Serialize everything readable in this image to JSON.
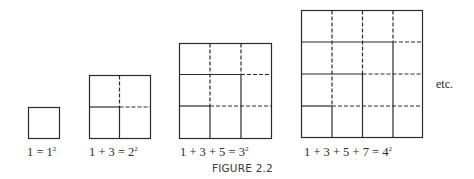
{
  "figure": {
    "caption": "FIGURE 2.2",
    "continuation_label": "etc.",
    "line_color": "#2a2a2a",
    "panels": [
      {
        "n": 1,
        "lhs": "1 = 1",
        "exponent": "2",
        "box": {
          "x": 28,
          "y": 107,
          "size": 31
        }
      },
      {
        "n": 2,
        "lhs": "1 + 3 = 2",
        "exponent": "2",
        "box": {
          "x": 89,
          "y": 75,
          "size": 62
        }
      },
      {
        "n": 3,
        "lhs": "1 + 3 + 5 = 3",
        "exponent": "2",
        "box": {
          "x": 179,
          "y": 43,
          "size": 93
        }
      },
      {
        "n": 4,
        "lhs": "1 + 3 + 5 + 7 = 4",
        "exponent": "2",
        "box": {
          "x": 301,
          "y": 10,
          "size": 122
        }
      }
    ]
  }
}
